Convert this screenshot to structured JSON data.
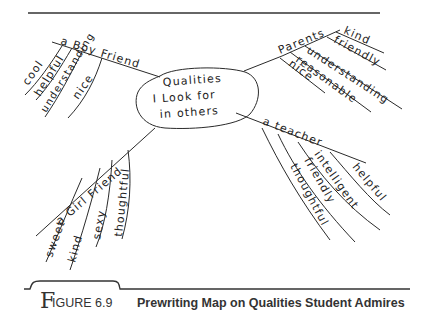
{
  "center": {
    "lines": [
      "Qualities",
      "I Look for",
      "in others"
    ]
  },
  "branches": {
    "boyfriend": {
      "label": "a Boy Friend",
      "items": [
        "cool",
        "helpful",
        "understanding",
        "nice"
      ]
    },
    "parents": {
      "label": "Parents",
      "items": [
        "kind",
        "friendly",
        "understanding",
        "reasonable",
        "nice"
      ]
    },
    "teacher": {
      "label": "a teacher",
      "items": [
        "helpful",
        "intelligent",
        "friendly",
        "thoughtful"
      ]
    },
    "girlfriend": {
      "label": "a Girl Friend",
      "items": [
        "sweet",
        "kind",
        "sexy",
        "thoughtful"
      ]
    }
  },
  "caption": {
    "first_letter": "F",
    "number": "IGURE 6.9",
    "title": "Prewriting Map on Qualities Student Admires"
  }
}
